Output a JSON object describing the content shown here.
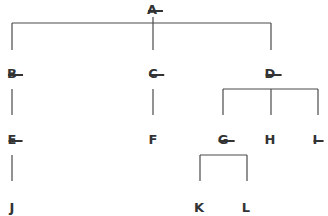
{
  "diagram": {
    "type": "tree",
    "nodes": [
      {
        "id": "A",
        "label": "A",
        "struck": true,
        "x": 152,
        "y": 10
      },
      {
        "id": "B",
        "label": "B",
        "struck": true,
        "x": 12,
        "y": 74
      },
      {
        "id": "C",
        "label": "C",
        "struck": true,
        "x": 153,
        "y": 74
      },
      {
        "id": "D",
        "label": "D",
        "struck": true,
        "x": 270,
        "y": 74
      },
      {
        "id": "E",
        "label": "E",
        "struck": true,
        "x": 12,
        "y": 140
      },
      {
        "id": "F",
        "label": "F",
        "struck": false,
        "x": 153,
        "y": 140
      },
      {
        "id": "G",
        "label": "G",
        "struck": true,
        "x": 223,
        "y": 140
      },
      {
        "id": "H",
        "label": "H",
        "struck": false,
        "x": 270,
        "y": 140
      },
      {
        "id": "I",
        "label": "I",
        "struck": true,
        "x": 315,
        "y": 140
      },
      {
        "id": "J",
        "label": "J",
        "struck": false,
        "x": 12,
        "y": 208
      },
      {
        "id": "K",
        "label": "K",
        "struck": false,
        "x": 199,
        "y": 208
      },
      {
        "id": "L",
        "label": "L",
        "struck": false,
        "x": 246,
        "y": 208
      }
    ],
    "edges": [
      {
        "from": "A",
        "to": "B"
      },
      {
        "from": "A",
        "to": "C"
      },
      {
        "from": "A",
        "to": "D"
      },
      {
        "from": "B",
        "to": "E"
      },
      {
        "from": "C",
        "to": "F"
      },
      {
        "from": "D",
        "to": "G"
      },
      {
        "from": "D",
        "to": "H"
      },
      {
        "from": "D",
        "to": "I"
      },
      {
        "from": "E",
        "to": "J"
      },
      {
        "from": "G",
        "to": "K"
      },
      {
        "from": "G",
        "to": "L"
      }
    ]
  }
}
